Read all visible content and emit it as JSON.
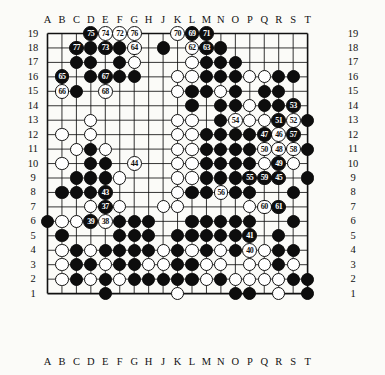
{
  "diagram": {
    "type": "go-board-problem-diagram",
    "size": 19,
    "col_labels": [
      "A",
      "B",
      "C",
      "D",
      "E",
      "F",
      "G",
      "H",
      "J",
      "K",
      "L",
      "M",
      "N",
      "O",
      "P",
      "Q",
      "R",
      "S",
      "T"
    ],
    "row_labels": [
      "19",
      "18",
      "17",
      "16",
      "15",
      "14",
      "13",
      "12",
      "11",
      "10",
      "9",
      "8",
      "7",
      "6",
      "5",
      "4",
      "3",
      "2",
      "1"
    ],
    "colors": {
      "black": "#0d0d0d",
      "white": "#ffffff",
      "line": "#111111",
      "paper": "#fbfbf8"
    },
    "black_stones": [
      [
        3,
        18
      ],
      [
        8,
        18
      ],
      [
        2,
        17
      ],
      [
        5,
        17
      ],
      [
        11,
        18
      ],
      [
        12,
        18
      ],
      [
        12,
        17
      ],
      [
        3,
        16
      ],
      [
        4,
        16
      ],
      [
        5,
        16
      ],
      [
        6,
        16
      ],
      [
        11,
        16
      ],
      [
        12,
        16
      ],
      [
        1,
        15
      ],
      [
        2,
        15
      ],
      [
        4,
        15
      ],
      [
        10,
        15
      ],
      [
        11,
        15
      ],
      [
        13,
        15
      ],
      [
        15,
        15
      ],
      [
        16,
        15
      ],
      [
        10,
        14
      ],
      [
        12,
        14
      ],
      [
        13,
        14
      ],
      [
        15,
        14
      ],
      [
        16,
        14
      ],
      [
        12,
        13
      ],
      [
        13,
        13
      ],
      [
        18,
        13
      ],
      [
        11,
        12
      ],
      [
        12,
        12
      ],
      [
        13,
        12
      ],
      [
        14,
        12
      ],
      [
        17,
        12
      ],
      [
        3,
        11
      ],
      [
        4,
        10
      ],
      [
        3,
        10
      ],
      [
        2,
        9
      ],
      [
        3,
        9
      ],
      [
        4,
        9
      ],
      [
        18,
        11
      ],
      [
        1,
        8
      ],
      [
        2,
        8
      ],
      [
        3,
        8
      ],
      [
        4,
        8
      ],
      [
        11,
        10
      ],
      [
        12,
        10
      ],
      [
        13,
        10
      ],
      [
        14,
        10
      ],
      [
        11,
        9
      ],
      [
        12,
        9
      ],
      [
        13,
        9
      ],
      [
        14,
        9
      ],
      [
        10,
        8
      ],
      [
        11,
        8
      ],
      [
        12,
        8
      ],
      [
        13,
        8
      ],
      [
        14,
        8
      ],
      [
        18,
        9
      ],
      [
        17,
        8
      ],
      [
        0,
        6
      ],
      [
        3,
        6
      ],
      [
        1,
        5
      ],
      [
        16,
        7
      ],
      [
        17,
        6
      ],
      [
        5,
        5
      ],
      [
        6,
        5
      ],
      [
        7,
        5
      ],
      [
        9,
        5
      ],
      [
        10,
        5
      ],
      [
        11,
        5
      ],
      [
        12,
        5
      ],
      [
        13,
        5
      ],
      [
        16,
        5
      ],
      [
        2,
        4
      ],
      [
        4,
        4
      ],
      [
        5,
        4
      ],
      [
        6,
        4
      ],
      [
        7,
        4
      ],
      [
        9,
        4
      ],
      [
        11,
        4
      ],
      [
        13,
        4
      ],
      [
        16,
        4
      ],
      [
        17,
        4
      ],
      [
        2,
        3
      ],
      [
        3,
        3
      ],
      [
        5,
        3
      ],
      [
        6,
        3
      ],
      [
        9,
        3
      ],
      [
        10,
        3
      ],
      [
        16,
        3
      ],
      [
        2,
        2
      ],
      [
        4,
        2
      ],
      [
        6,
        2
      ],
      [
        7,
        2
      ],
      [
        8,
        2
      ],
      [
        9,
        2
      ],
      [
        10,
        2
      ],
      [
        12,
        2
      ],
      [
        17,
        2
      ],
      [
        4,
        1
      ],
      [
        13,
        1
      ],
      [
        14,
        1
      ],
      [
        18,
        1
      ],
      [
        18,
        2
      ],
      [
        17,
        16
      ],
      [
        16,
        16
      ],
      [
        13,
        16
      ],
      [
        13,
        17
      ],
      [
        11,
        17
      ],
      [
        3,
        17
      ],
      [
        5,
        18
      ],
      [
        12,
        11
      ],
      [
        13,
        11
      ],
      [
        14,
        11
      ],
      [
        11,
        11
      ],
      [
        5,
        6
      ],
      [
        6,
        6
      ],
      [
        7,
        6
      ],
      [
        10,
        6
      ],
      [
        11,
        6
      ],
      [
        12,
        6
      ],
      [
        13,
        6
      ],
      [
        14,
        6
      ]
    ],
    "white_stones": [
      [
        6,
        17
      ],
      [
        10,
        17
      ],
      [
        11,
        15
      ],
      [
        12,
        15
      ],
      [
        1,
        12
      ],
      [
        3,
        12
      ],
      [
        2,
        11
      ],
      [
        4,
        11
      ],
      [
        1,
        10
      ],
      [
        3,
        13
      ],
      [
        5,
        9
      ],
      [
        3,
        7
      ],
      [
        5,
        7
      ],
      [
        8,
        7
      ],
      [
        9,
        7
      ],
      [
        1,
        6
      ],
      [
        2,
        6
      ],
      [
        4,
        6
      ],
      [
        1,
        4
      ],
      [
        3,
        4
      ],
      [
        8,
        4
      ],
      [
        10,
        4
      ],
      [
        12,
        4
      ],
      [
        14,
        4
      ],
      [
        15,
        4
      ],
      [
        1,
        3
      ],
      [
        4,
        3
      ],
      [
        7,
        3
      ],
      [
        8,
        3
      ],
      [
        11,
        3
      ],
      [
        12,
        3
      ],
      [
        14,
        3
      ],
      [
        15,
        3
      ],
      [
        17,
        3
      ],
      [
        1,
        2
      ],
      [
        3,
        2
      ],
      [
        5,
        2
      ],
      [
        11,
        2
      ],
      [
        13,
        2
      ],
      [
        14,
        2
      ],
      [
        15,
        2
      ],
      [
        16,
        2
      ],
      [
        16,
        1
      ],
      [
        9,
        1
      ],
      [
        10,
        13
      ],
      [
        10,
        12
      ],
      [
        9,
        11
      ],
      [
        10,
        11
      ],
      [
        14,
        13
      ],
      [
        15,
        13
      ],
      [
        16,
        13
      ],
      [
        17,
        13
      ],
      [
        14,
        14
      ],
      [
        15,
        14
      ],
      [
        9,
        9
      ],
      [
        10,
        9
      ],
      [
        15,
        9
      ],
      [
        16,
        9
      ],
      [
        15,
        10
      ],
      [
        16,
        10
      ],
      [
        17,
        10
      ],
      [
        9,
        8
      ],
      [
        10,
        8
      ],
      [
        14,
        7
      ],
      [
        15,
        7
      ],
      [
        16,
        12
      ],
      [
        15,
        12
      ],
      [
        14,
        16
      ],
      [
        15,
        16
      ],
      [
        12,
        15
      ],
      [
        9,
        16
      ],
      [
        9,
        15
      ],
      [
        10,
        16
      ],
      [
        9,
        13
      ],
      [
        10,
        10
      ],
      [
        9,
        10
      ],
      [
        9,
        12
      ]
    ],
    "moves": [
      {
        "n": "37",
        "col": "E",
        "row": 7,
        "color": "b"
      },
      {
        "n": "38",
        "col": "E",
        "row": 6,
        "color": "w"
      },
      {
        "n": "39",
        "col": "D",
        "row": 6,
        "color": "b"
      },
      {
        "n": "40",
        "col": "P",
        "row": 4,
        "color": "w"
      },
      {
        "n": "41",
        "col": "P",
        "row": 5,
        "color": "b"
      },
      {
        "n": "43",
        "col": "E",
        "row": 8,
        "color": "b"
      },
      {
        "n": "44",
        "col": "G",
        "row": 10,
        "color": "w"
      },
      {
        "n": "45",
        "col": "R",
        "row": 9,
        "color": "b"
      },
      {
        "n": "46",
        "col": "R",
        "row": 12,
        "color": "w"
      },
      {
        "n": "47",
        "col": "Q",
        "row": 12,
        "color": "b"
      },
      {
        "n": "48",
        "col": "R",
        "row": 11,
        "color": "w"
      },
      {
        "n": "49",
        "col": "R",
        "row": 10,
        "color": "b"
      },
      {
        "n": "50",
        "col": "Q",
        "row": 11,
        "color": "w"
      },
      {
        "n": "51",
        "col": "R",
        "row": 13,
        "color": "b"
      },
      {
        "n": "52",
        "col": "S",
        "row": 13,
        "color": "w"
      },
      {
        "n": "53",
        "col": "S",
        "row": 14,
        "color": "b"
      },
      {
        "n": "54",
        "col": "O",
        "row": 13,
        "color": "w"
      },
      {
        "n": "55",
        "col": "P",
        "row": 9,
        "color": "b"
      },
      {
        "n": "56",
        "col": "N",
        "row": 8,
        "color": "w"
      },
      {
        "n": "57",
        "col": "S",
        "row": 12,
        "color": "b"
      },
      {
        "n": "58",
        "col": "S",
        "row": 11,
        "color": "w"
      },
      {
        "n": "59",
        "col": "Q",
        "row": 9,
        "color": "b"
      },
      {
        "n": "60",
        "col": "Q",
        "row": 7,
        "color": "w"
      },
      {
        "n": "61",
        "col": "R",
        "row": 7,
        "color": "b"
      },
      {
        "n": "62",
        "col": "L",
        "row": 18,
        "color": "w"
      },
      {
        "n": "63",
        "col": "M",
        "row": 18,
        "color": "b"
      },
      {
        "n": "64",
        "col": "G",
        "row": 18,
        "color": "w"
      },
      {
        "n": "65",
        "col": "B",
        "row": 16,
        "color": "b"
      },
      {
        "n": "66",
        "col": "B",
        "row": 15,
        "color": "w"
      },
      {
        "n": "67",
        "col": "E",
        "row": 16,
        "color": "b"
      },
      {
        "n": "68",
        "col": "E",
        "row": 15,
        "color": "w"
      },
      {
        "n": "69",
        "col": "L",
        "row": 19,
        "color": "b"
      },
      {
        "n": "70",
        "col": "K",
        "row": 19,
        "color": "w"
      },
      {
        "n": "71",
        "col": "M",
        "row": 19,
        "color": "b"
      },
      {
        "n": "72",
        "col": "F",
        "row": 19,
        "color": "w"
      },
      {
        "n": "73",
        "col": "E",
        "row": 18,
        "color": "b"
      },
      {
        "n": "74",
        "col": "E",
        "row": 19,
        "color": "w"
      },
      {
        "n": "75",
        "col": "D",
        "row": 19,
        "color": "b"
      },
      {
        "n": "76",
        "col": "G",
        "row": 19,
        "color": "w"
      },
      {
        "n": "77",
        "col": "C",
        "row": 18,
        "color": "b"
      }
    ]
  }
}
